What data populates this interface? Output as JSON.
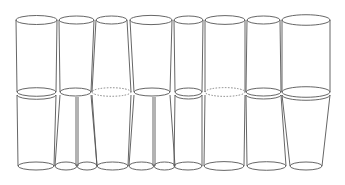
{
  "diagram": {
    "type": "line-art cylinder arrangement",
    "stroke_color": "#555555",
    "background": "#ffffff",
    "top_y": 20,
    "mid_y": 92,
    "bottom_y": 166,
    "cylinders": [
      {
        "id": 1,
        "top": [
          16,
          57
        ],
        "mid": [
          17,
          56
        ],
        "mid_style": "double",
        "bottom": [
          [
            18,
            54
          ]
        ]
      },
      {
        "id": 2,
        "top": [
          59,
          94
        ],
        "mid": [
          60,
          91
        ],
        "mid_style": "single",
        "bottom": [
          [
            55,
            77
          ],
          [
            77,
            97
          ]
        ]
      },
      {
        "id": 3,
        "top": [
          96,
          127
        ],
        "mid": [
          92,
          131
        ],
        "mid_style": "dashed",
        "bottom": [
          [
            97,
            128
          ]
        ]
      },
      {
        "id": 4,
        "top": [
          130,
          172
        ],
        "mid": [
          134,
          170
        ],
        "mid_style": "single",
        "bottom": [
          [
            129,
            154
          ],
          [
            154,
            175
          ]
        ]
      },
      {
        "id": 5,
        "top": [
          174,
          203
        ],
        "mid": [
          175,
          202
        ],
        "mid_style": "double",
        "bottom": [
          [
            174,
            202
          ]
        ]
      },
      {
        "id": 6,
        "top": [
          205,
          245
        ],
        "mid": [
          205,
          245
        ],
        "mid_style": "dashed",
        "bottom": [
          [
            204,
            244
          ]
        ]
      },
      {
        "id": 7,
        "top": [
          247,
          280
        ],
        "mid": [
          246,
          281
        ],
        "mid_style": "double",
        "bottom": [
          [
            247,
            286
          ]
        ]
      },
      {
        "id": 8,
        "top": [
          282,
          330
        ],
        "mid": [
          282,
          330
        ],
        "mid_style": "double",
        "bottom": [
          [
            290,
            322
          ]
        ]
      }
    ]
  }
}
